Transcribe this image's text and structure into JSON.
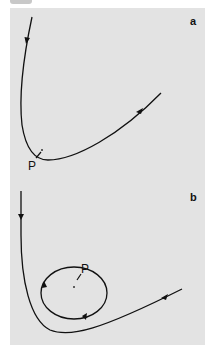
{
  "figure": {
    "panels": [
      {
        "id": "a",
        "label": "a",
        "point_label": "P",
        "description": "Trajectory approaching point P and continuing past it"
      },
      {
        "id": "b",
        "label": "b",
        "point_label": "P",
        "description": "Trajectory with a closed loop around point P"
      }
    ],
    "colors": {
      "background": "#e3e3e3",
      "curve": "#111111"
    }
  }
}
